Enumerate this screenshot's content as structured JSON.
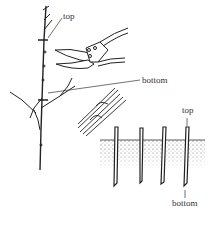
{
  "diagram": {
    "labels": {
      "cutting_top": "top",
      "cutting_bottom": "bottom",
      "planted_top": "top",
      "planted_bottom": "bottom"
    },
    "elements": [
      "branch-with-cut-marks",
      "pruning-shears",
      "bundle-of-cuttings",
      "cuttings-planted-in-soil"
    ],
    "planted_cuttings_count": 4
  }
}
